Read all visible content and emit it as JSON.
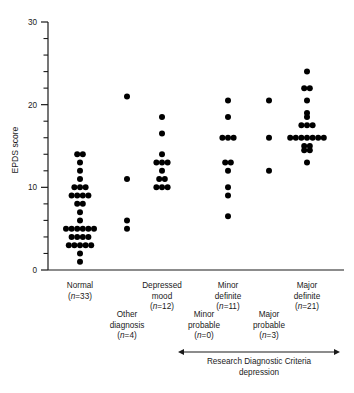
{
  "chart_data": {
    "type": "scatter",
    "title": "",
    "xlabel": "",
    "ylabel": "EPDS score",
    "ylim": [
      0,
      30
    ],
    "yticks": [
      0,
      10,
      20,
      30
    ],
    "ytick_labels": [
      "0",
      "10",
      "20",
      "30"
    ],
    "yminor_step": 2,
    "grid": false,
    "legend": false,
    "dot_color": "#000000",
    "axis_color": "#1a1a1a",
    "categories": [
      {
        "id": "normal",
        "label": "Normal",
        "n_text": "(n=33)",
        "n": 33,
        "row": "top",
        "values": [
          14,
          14,
          13,
          12,
          11,
          10,
          10,
          10,
          9,
          9,
          9,
          9,
          8,
          8,
          7,
          6,
          5,
          5,
          5,
          5,
          5,
          5,
          4,
          4,
          4,
          4,
          3,
          3,
          3,
          3,
          3,
          2,
          1
        ]
      },
      {
        "id": "other-diagnosis",
        "label": "Other diagnosis",
        "label_line1": "Other",
        "label_line2": "diagnosis",
        "n_text": "(n=4)",
        "n": 4,
        "row": "bottom",
        "values": [
          21,
          11,
          6,
          5
        ]
      },
      {
        "id": "depressed-mood",
        "label": "Depressed mood",
        "label_line1": "Depressed",
        "label_line2": "mood",
        "n_text": "(n=12)",
        "n": 12,
        "row": "top",
        "values": [
          18.5,
          16.5,
          14,
          13,
          13,
          13,
          12,
          11,
          11,
          10,
          10,
          10
        ]
      },
      {
        "id": "minor-probable",
        "label": "Minor probable",
        "label_line1": "Minor",
        "label_line2": "probable",
        "n_text": "(n=0)",
        "n": 0,
        "row": "bottom",
        "values": []
      },
      {
        "id": "minor-definite",
        "label": "Minor definite",
        "label_line1": "Minor",
        "label_line2": "definite",
        "n_text": "(n=11)",
        "n": 11,
        "row": "top",
        "values": [
          20.5,
          18.5,
          16,
          16,
          16,
          13,
          13,
          12,
          10,
          9,
          6.5
        ]
      },
      {
        "id": "major-probable",
        "label": "Major probable",
        "label_line1": "Major",
        "label_line2": "probable",
        "n_text": "(n=3)",
        "n": 3,
        "row": "bottom",
        "values": [
          20.5,
          16,
          12
        ]
      },
      {
        "id": "major-definite",
        "label": "Major definite",
        "label_line1": "Major",
        "label_line2": "definite",
        "n_text": "(n=21)",
        "n": 21,
        "row": "top",
        "values": [
          24,
          22,
          22,
          20.5,
          19,
          18.5,
          17.5,
          17.5,
          17.5,
          16,
          16,
          16,
          16,
          16,
          16,
          16,
          15,
          15,
          14.5,
          14.5,
          13
        ]
      }
    ],
    "annotation": {
      "line1": "Research  Diagnostic  Criteria",
      "line2": "depression",
      "arrow_from": "minor-probable",
      "arrow_to": "major-definite"
    }
  }
}
